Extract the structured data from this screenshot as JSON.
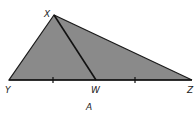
{
  "diagram": {
    "caption": "A",
    "fill_color": "#8a8a8a",
    "stroke_color": "#1a1a1a",
    "vertices": {
      "X": {
        "label": "X",
        "x": 54,
        "y": 15
      },
      "Y": {
        "label": "Y",
        "x": 9,
        "y": 80
      },
      "W": {
        "label": "W",
        "x": 96,
        "y": 80
      },
      "Z": {
        "label": "Z",
        "x": 192,
        "y": 80
      }
    },
    "segments": [
      "XY",
      "XZ",
      "YZ",
      "XW"
    ],
    "tick_marks": [
      {
        "segment": "YW",
        "x": 53,
        "y": 80
      },
      {
        "segment": "WZ",
        "x": 135,
        "y": 80
      }
    ],
    "labels": {
      "X": "X",
      "Y": "Y",
      "W": "W",
      "Z": "Z"
    }
  }
}
